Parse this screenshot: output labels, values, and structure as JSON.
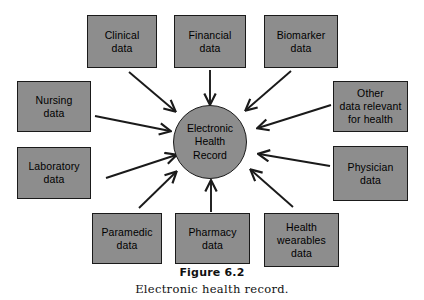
{
  "figure": {
    "caption_title": "Figure 6.2",
    "caption_subtitle": "Electronic health record."
  },
  "colors": {
    "node_fill": "#8d8d8d",
    "node_stroke": "#1a1a1a",
    "arrow": "#1a1a1a",
    "background": "#ffffff",
    "text": "#000000"
  },
  "hub": {
    "line1": "Electronic",
    "line2": "Health",
    "line3": "Record"
  },
  "nodes": [
    {
      "id": "clinical-data",
      "line1": "Clinical",
      "line2": "data",
      "line3": ""
    },
    {
      "id": "financial-data",
      "line1": "Financial",
      "line2": "data",
      "line3": ""
    },
    {
      "id": "biomarker-data",
      "line1": "Biomarker",
      "line2": "data",
      "line3": ""
    },
    {
      "id": "nursing-data",
      "line1": "Nursing",
      "line2": "data",
      "line3": ""
    },
    {
      "id": "other-data-relevant-for-health",
      "line1": "Other",
      "line2": "data relevant",
      "line3": "for health"
    },
    {
      "id": "laboratory-data",
      "line1": "Laboratory",
      "line2": "data",
      "line3": ""
    },
    {
      "id": "physician-data",
      "line1": "Physician",
      "line2": "data",
      "line3": ""
    },
    {
      "id": "paramedic-data",
      "line1": "Paramedic",
      "line2": "data",
      "line3": ""
    },
    {
      "id": "pharmacy-data",
      "line1": "Pharmacy",
      "line2": "data",
      "line3": ""
    },
    {
      "id": "health-wearables-data",
      "line1": "Health",
      "line2": "wearables",
      "line3": "data"
    }
  ],
  "arrows": [
    {
      "from": "clinical-data",
      "to": "hub"
    },
    {
      "from": "financial-data",
      "to": "hub"
    },
    {
      "from": "biomarker-data",
      "to": "hub"
    },
    {
      "from": "nursing-data",
      "to": "hub"
    },
    {
      "from": "other-data-relevant-for-health",
      "to": "hub"
    },
    {
      "from": "laboratory-data",
      "to": "hub"
    },
    {
      "from": "physician-data",
      "to": "hub"
    },
    {
      "from": "paramedic-data",
      "to": "hub"
    },
    {
      "from": "pharmacy-data",
      "to": "hub"
    },
    {
      "from": "health-wearables-data",
      "to": "hub"
    }
  ]
}
